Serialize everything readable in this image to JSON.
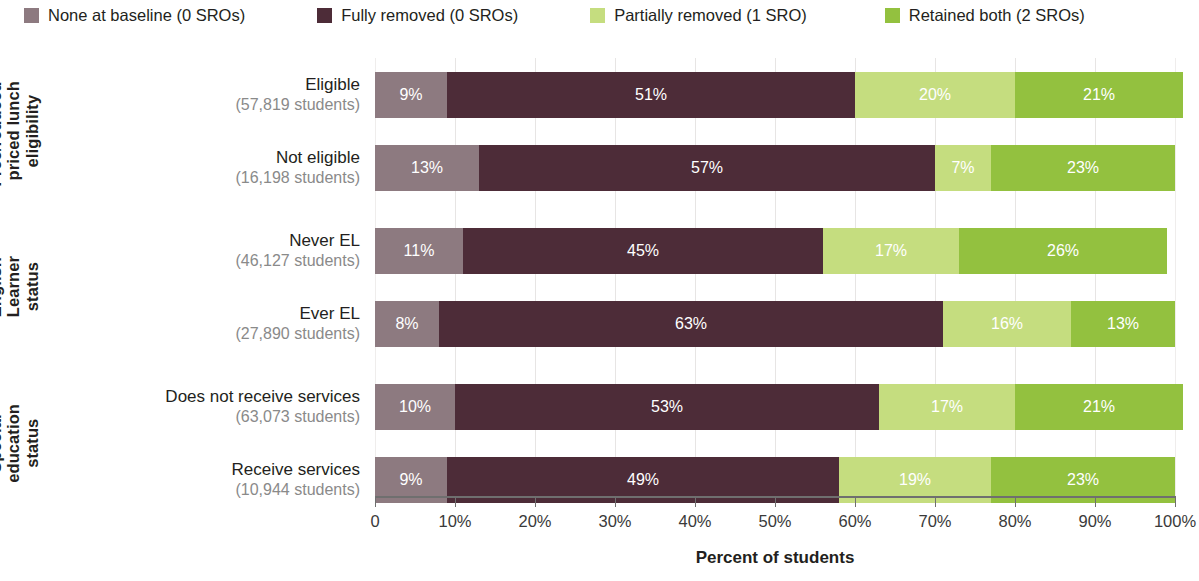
{
  "legend": {
    "items": [
      {
        "label": "None at baseline (0 SROs)",
        "color": "#8d7a80"
      },
      {
        "label": "Fully removed (0 SROs)",
        "color": "#4d2c38"
      },
      {
        "label": "Partially removed (1 SRO)",
        "color": "#c5dd7f"
      },
      {
        "label": "Retained both (2 SROs)",
        "color": "#93c13f"
      }
    ]
  },
  "axis": {
    "title": "Percent of students",
    "ticks": [
      "0",
      "10%",
      "20%",
      "30%",
      "40%",
      "50%",
      "60%",
      "70%",
      "80%",
      "90%",
      "100%"
    ]
  },
  "groups": [
    {
      "title": "Free/reduced-\npriced lunch\neligibility",
      "rows": [
        {
          "category": "Eligible",
          "subtitle": "(57,819 students)"
        },
        {
          "category": "Not eligible",
          "subtitle": "(16,198 students)"
        }
      ]
    },
    {
      "title": "English\nLearner\nstatus",
      "rows": [
        {
          "category": "Never EL",
          "subtitle": "(46,127 students)"
        },
        {
          "category": "Ever EL",
          "subtitle": "(27,890 students)"
        }
      ]
    },
    {
      "title": "Special\neducation\nstatus",
      "rows": [
        {
          "category": "Does not receive services",
          "subtitle": "(63,073 students)"
        },
        {
          "category": "Receive services",
          "subtitle": "(10,944 students)"
        }
      ]
    }
  ],
  "chart_data": {
    "type": "bar",
    "orientation": "horizontal",
    "stacked": true,
    "normalized": "percent",
    "title": "",
    "xlabel": "Percent of students",
    "ylabel": "",
    "xlim": [
      0,
      100
    ],
    "xticks": [
      0,
      10,
      20,
      30,
      40,
      50,
      60,
      70,
      80,
      90,
      100
    ],
    "xticklabels": [
      "0",
      "10%",
      "20%",
      "30%",
      "40%",
      "50%",
      "60%",
      "70%",
      "80%",
      "90%",
      "100%"
    ],
    "grid": "vertical",
    "legend_position": "top",
    "series": [
      {
        "name": "None at baseline (0 SROs)",
        "color": "#8d7a80",
        "values": [
          9,
          13,
          11,
          8,
          10,
          9
        ]
      },
      {
        "name": "Fully removed (0 SROs)",
        "color": "#4d2c38",
        "values": [
          51,
          57,
          45,
          63,
          53,
          49
        ]
      },
      {
        "name": "Partially removed (1 SRO)",
        "color": "#c5dd7f",
        "values": [
          20,
          7,
          17,
          16,
          17,
          19
        ]
      },
      {
        "name": "Retained both (2 SROs)",
        "color": "#93c13f",
        "values": [
          21,
          23,
          26,
          13,
          21,
          23
        ]
      }
    ],
    "categories": [
      "Eligible (57,819 students)",
      "Not eligible (16,198 students)",
      "Never EL (46,127 students)",
      "Ever EL (27,890 students)",
      "Does not receive services (63,073 students)",
      "Receive services (10,944 students)"
    ],
    "category_groups": [
      {
        "label": "Free/reduced-priced lunch eligibility",
        "categories": [
          "Eligible",
          "Not eligible"
        ]
      },
      {
        "label": "English Learner status",
        "categories": [
          "Never EL",
          "Ever EL"
        ]
      },
      {
        "label": "Special education status",
        "categories": [
          "Does not receive services",
          "Receive services"
        ]
      }
    ],
    "data_labels": [
      [
        "9%",
        "51%",
        "20%",
        "21%"
      ],
      [
        "13%",
        "57%",
        "7%",
        "23%"
      ],
      [
        "11%",
        "45%",
        "17%",
        "26%"
      ],
      [
        "8%",
        "63%",
        "16%",
        "13%"
      ],
      [
        "10%",
        "53%",
        "17%",
        "21%"
      ],
      [
        "9%",
        "49%",
        "19%",
        "23%"
      ]
    ]
  }
}
